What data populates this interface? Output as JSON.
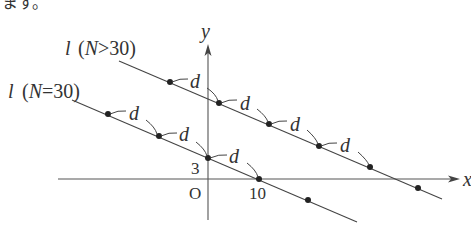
{
  "header_fragment": "ます。",
  "axes": {
    "x_label": "x",
    "y_label": "y",
    "origin_label": "O",
    "x_tick": "10",
    "y_tick": "3"
  },
  "lines": [
    {
      "name": "l",
      "condition": "(N>30)",
      "label_l": "l",
      "label_paren": "(N>30)"
    },
    {
      "name": "l",
      "condition": "(N=30)",
      "label_l": "l",
      "label_paren": "(N=30)"
    }
  ],
  "spacing_label": "d",
  "colors": {
    "line": "#444444",
    "dot": "#222222",
    "background": "#ffffff"
  }
}
